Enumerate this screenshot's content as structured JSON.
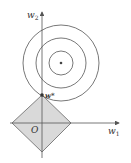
{
  "labels": {
    "y_axis": "w",
    "y_axis_sub": "2",
    "x_axis": "w",
    "x_axis_sub": "1",
    "origin": "O",
    "optimum": "w*"
  },
  "colors": {
    "diamond_fill": "#d9d9d9",
    "stroke": "#555555"
  }
}
